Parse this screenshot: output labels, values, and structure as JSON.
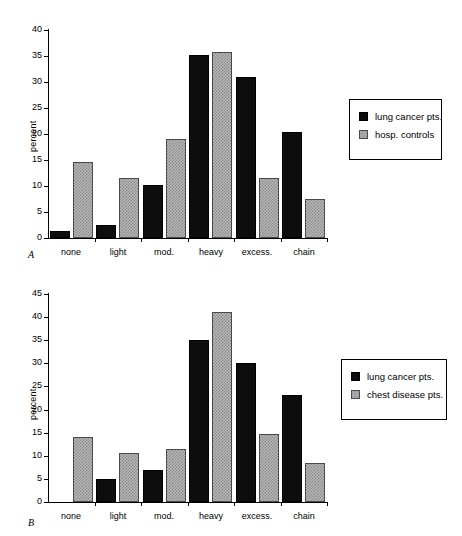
{
  "figure": {
    "background_color": "#ffffff",
    "series_colors": {
      "dark": "#0d0d0d",
      "light": "#b5b5b5"
    }
  },
  "panels": [
    {
      "letter": "A",
      "ylabel": "percent",
      "legend": [
        {
          "label": "lung cancer pts.",
          "swatch": "dark-swatch-icon"
        },
        {
          "label": "hosp. controls",
          "swatch": "light-swatch-icon"
        }
      ]
    },
    {
      "letter": "B",
      "ylabel": "percent",
      "legend": [
        {
          "label": "lung cancer pts.",
          "swatch": "dark-swatch-icon"
        },
        {
          "label": "chest disease pts.",
          "swatch": "light-swatch-icon"
        }
      ]
    }
  ],
  "chart_data": [
    {
      "type": "bar",
      "panel": "A",
      "title": "",
      "xlabel": "",
      "ylabel": "percent",
      "ylim": [
        0,
        40
      ],
      "yticks": [
        0,
        5,
        10,
        15,
        20,
        25,
        30,
        35,
        40
      ],
      "ytick_labels": [
        "0",
        "5",
        "10",
        "15",
        "20",
        "25",
        "30",
        "35",
        "40"
      ],
      "grid": false,
      "legend_position": "right",
      "categories": [
        "none",
        "light",
        "mod.",
        "heavy",
        "excess.",
        "chain"
      ],
      "series": [
        {
          "name": "lung cancer pts.",
          "color": "#0d0d0d",
          "values": [
            1.3,
            2.5,
            10.1,
            35.2,
            31.0,
            20.3
          ]
        },
        {
          "name": "hosp. controls",
          "color": "#b5b5b5",
          "values": [
            14.7,
            11.5,
            19.0,
            35.8,
            11.5,
            7.5
          ]
        }
      ]
    },
    {
      "type": "bar",
      "panel": "B",
      "title": "",
      "xlabel": "",
      "ylabel": "percent",
      "ylim": [
        0,
        45
      ],
      "yticks": [
        0,
        5,
        10,
        15,
        20,
        25,
        30,
        35,
        40,
        45
      ],
      "ytick_labels": [
        "0",
        "5",
        "10",
        "15",
        "20",
        "25",
        "30",
        "35",
        "40",
        "45"
      ],
      "grid": false,
      "legend_position": "right",
      "categories": [
        "none",
        "light",
        "mod.",
        "heavy",
        "excess.",
        "chain"
      ],
      "series": [
        {
          "name": "lung cancer pts.",
          "color": "#0d0d0d",
          "values": [
            0,
            5.0,
            7.0,
            35.0,
            30.0,
            23.1
          ]
        },
        {
          "name": "chest disease pts.",
          "color": "#b5b5b5",
          "values": [
            14.1,
            10.6,
            11.4,
            41.0,
            14.7,
            8.5
          ]
        }
      ]
    }
  ]
}
